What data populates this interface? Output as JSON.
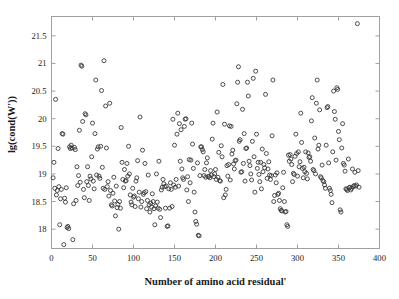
{
  "chart_data": {
    "type": "scatter",
    "title": "",
    "xlabel": "Number of amino acid residual'",
    "ylabel": "lg(cond(W'))",
    "xlim": [
      0,
      400
    ],
    "ylim": [
      17.65,
      21.85
    ],
    "xticks": [
      0,
      50,
      100,
      150,
      200,
      250,
      300,
      350,
      400
    ],
    "xticklabels": [
      "0",
      "50",
      "100",
      "150",
      "200",
      "250",
      "300",
      "350",
      "400"
    ],
    "yticks": [
      18,
      18.5,
      19,
      19.5,
      20,
      20.5,
      21,
      21.5
    ],
    "yticklabels": [
      "18",
      "18.5",
      "19",
      "19.5",
      "20",
      "20.5",
      "21",
      "21.5"
    ],
    "grid": false,
    "legend": null,
    "marker": "open-circle",
    "marker_color": "#3a3a3a",
    "marker_size": 4,
    "axis_color": "#a0a0a0",
    "background": "#ffffff",
    "n_points": 398,
    "points": [
      [
        2,
        18.93
      ],
      [
        3,
        19.21
      ],
      [
        4,
        18.74
      ],
      [
        5,
        20.35
      ],
      [
        6,
        18.62
      ],
      [
        7,
        18.7
      ],
      [
        8,
        19.46
      ],
      [
        9,
        18.77
      ],
      [
        10,
        18.08
      ],
      [
        11,
        18.55
      ],
      [
        12,
        18.72
      ],
      [
        13,
        19.73
      ],
      [
        14,
        19.72
      ],
      [
        15,
        17.72
      ],
      [
        16,
        18.56
      ],
      [
        17,
        18.49
      ],
      [
        18,
        18.75
      ],
      [
        19,
        18.03
      ],
      [
        20,
        18.05
      ],
      [
        21,
        18.01
      ],
      [
        22,
        19.49
      ],
      [
        23,
        19.46
      ],
      [
        24,
        19.52
      ],
      [
        25,
        19.47
      ],
      [
        26,
        17.81
      ],
      [
        27,
        18.46
      ],
      [
        28,
        19.48
      ],
      [
        29,
        19.44
      ],
      [
        30,
        18.52
      ],
      [
        31,
        19.13
      ],
      [
        32,
        18.79
      ],
      [
        33,
        18.97
      ],
      [
        34,
        19.79
      ],
      [
        35,
        18.85
      ],
      [
        36,
        20.97
      ],
      [
        37,
        20.95
      ],
      [
        38,
        19.95
      ],
      [
        39,
        18.72
      ],
      [
        40,
        18.57
      ],
      [
        41,
        20.09
      ],
      [
        42,
        20.07
      ],
      [
        43,
        18.86
      ],
      [
        44,
        19.13
      ],
      [
        45,
        18.79
      ],
      [
        46,
        18.52
      ],
      [
        47,
        18.96
      ],
      [
        48,
        18.91
      ],
      [
        49,
        19.31
      ],
      [
        50,
        19.92
      ],
      [
        51,
        18.87
      ],
      [
        52,
        18.73
      ],
      [
        53,
        19.73
      ],
      [
        54,
        20.7
      ],
      [
        55,
        18.98
      ],
      [
        56,
        19.45
      ],
      [
        57,
        19.49
      ],
      [
        58,
        18.96
      ],
      [
        59,
        18.92
      ],
      [
        60,
        19.5
      ],
      [
        61,
        20.51
      ],
      [
        62,
        19.12
      ],
      [
        63,
        18.74
      ],
      [
        64,
        21.05
      ],
      [
        65,
        18.72
      ],
      [
        66,
        20.23
      ],
      [
        67,
        19.47
      ],
      [
        68,
        18.77
      ],
      [
        69,
        18.86
      ],
      [
        70,
        18.6
      ],
      [
        71,
        20.28
      ],
      [
        72,
        18.7
      ],
      [
        73,
        18.44
      ],
      [
        74,
        18.42
      ],
      [
        75,
        18.65
      ],
      [
        76,
        18.94
      ],
      [
        77,
        18.51
      ],
      [
        78,
        18.24
      ],
      [
        79,
        18.78
      ],
      [
        80,
        18.39
      ],
      [
        81,
        18.45
      ],
      [
        82,
        18.0
      ],
      [
        83,
        18.5
      ],
      [
        84,
        18.38
      ],
      [
        85,
        19.84
      ],
      [
        86,
        19.21
      ],
      [
        87,
        18.9
      ],
      [
        88,
        18.75
      ],
      [
        89,
        19.08
      ],
      [
        90,
        18.87
      ],
      [
        91,
        18.88
      ],
      [
        92,
        19.19
      ],
      [
        93,
        18.96
      ],
      [
        94,
        19.5
      ],
      [
        95,
        19.0
      ],
      [
        96,
        18.62
      ],
      [
        97,
        18.49
      ],
      [
        98,
        18.44
      ],
      [
        99,
        18.74
      ],
      [
        100,
        18.58
      ],
      [
        101,
        18.6
      ],
      [
        102,
        18.41
      ],
      [
        103,
        18.87
      ],
      [
        104,
        18.93
      ],
      [
        105,
        19.24
      ],
      [
        106,
        18.55
      ],
      [
        107,
        18.67
      ],
      [
        108,
        20.03
      ],
      [
        109,
        18.4
      ],
      [
        110,
        18.5
      ],
      [
        111,
        19.43
      ],
      [
        112,
        18.63
      ],
      [
        113,
        18.66
      ],
      [
        114,
        19.19
      ],
      [
        115,
        18.68
      ],
      [
        116,
        18.37
      ],
      [
        117,
        18.52
      ],
      [
        118,
        18.98
      ],
      [
        119,
        18.44
      ],
      [
        120,
        18.31
      ],
      [
        121,
        18.47
      ],
      [
        122,
        18.4
      ],
      [
        123,
        18.64
      ],
      [
        124,
        18.5
      ],
      [
        125,
        18.37
      ],
      [
        126,
        18.08
      ],
      [
        127,
        18.42
      ],
      [
        128,
        19.0
      ],
      [
        129,
        18.49
      ],
      [
        130,
        18.38
      ],
      [
        131,
        19.23
      ],
      [
        132,
        18.36
      ],
      [
        133,
        18.21
      ],
      [
        134,
        18.71
      ],
      [
        135,
        18.76
      ],
      [
        136,
        18.9
      ],
      [
        137,
        18.82
      ],
      [
        138,
        18.77
      ],
      [
        139,
        18.38
      ],
      [
        140,
        18.78
      ],
      [
        141,
        18.05
      ],
      [
        142,
        18.06
      ],
      [
        143,
        18.73
      ],
      [
        144,
        18.38
      ],
      [
        145,
        18.84
      ],
      [
        146,
        18.72
      ],
      [
        147,
        18.41
      ],
      [
        148,
        19.99
      ],
      [
        149,
        18.8
      ],
      [
        150,
        19.52
      ],
      [
        151,
        18.76
      ],
      [
        152,
        18.9
      ],
      [
        153,
        19.72
      ],
      [
        154,
        20.1
      ],
      [
        155,
        18.78
      ],
      [
        156,
        19.91
      ],
      [
        157,
        19.23
      ],
      [
        158,
        19.8
      ],
      [
        159,
        19.09
      ],
      [
        160,
        18.93
      ],
      [
        161,
        18.9
      ],
      [
        162,
        19.86
      ],
      [
        163,
        19.99
      ],
      [
        164,
        20.0
      ],
      [
        165,
        18.71
      ],
      [
        166,
        18.95
      ],
      [
        167,
        18.5
      ],
      [
        168,
        19.26
      ],
      [
        169,
        18.84
      ],
      [
        170,
        19.25
      ],
      [
        171,
        19.92
      ],
      [
        172,
        19.54
      ],
      [
        173,
        19.1
      ],
      [
        174,
        18.67
      ],
      [
        175,
        18.31
      ],
      [
        176,
        18.14
      ],
      [
        177,
        18.09
      ],
      [
        178,
        19.2
      ],
      [
        179,
        17.89
      ],
      [
        180,
        17.88
      ],
      [
        181,
        18.97
      ],
      [
        182,
        19.49
      ],
      [
        183,
        19.49
      ],
      [
        184,
        19.44
      ],
      [
        185,
        19.4
      ],
      [
        186,
        18.97
      ],
      [
        187,
        19.08
      ],
      [
        188,
        18.94
      ],
      [
        189,
        19.2
      ],
      [
        190,
        19.29
      ],
      [
        191,
        18.95
      ],
      [
        192,
        18.96
      ],
      [
        193,
        18.93
      ],
      [
        194,
        19.06
      ],
      [
        195,
        18.98
      ],
      [
        196,
        19.63
      ],
      [
        197,
        19.92
      ],
      [
        198,
        18.95
      ],
      [
        199,
        19.0
      ],
      [
        200,
        19.08
      ],
      [
        201,
        18.9
      ],
      [
        202,
        20.12
      ],
      [
        203,
        18.94
      ],
      [
        204,
        19.39
      ],
      [
        205,
        18.88
      ],
      [
        206,
        18.87
      ],
      [
        207,
        19.51
      ],
      [
        208,
        19.31
      ],
      [
        209,
        20.62
      ],
      [
        210,
        18.57
      ],
      [
        211,
        19.9
      ],
      [
        212,
        18.62
      ],
      [
        213,
        18.72
      ],
      [
        214,
        19.15
      ],
      [
        215,
        18.96
      ],
      [
        216,
        19.17
      ],
      [
        217,
        19.87
      ],
      [
        218,
        18.89
      ],
      [
        219,
        19.86
      ],
      [
        220,
        19.36
      ],
      [
        221,
        19.43
      ],
      [
        222,
        19.18
      ],
      [
        223,
        19.09
      ],
      [
        224,
        19.24
      ],
      [
        225,
        19.25
      ],
      [
        226,
        20.27
      ],
      [
        227,
        20.66
      ],
      [
        228,
        20.94
      ],
      [
        229,
        19.59
      ],
      [
        230,
        19.62
      ],
      [
        231,
        19.03
      ],
      [
        232,
        19.04
      ],
      [
        233,
        20.17
      ],
      [
        234,
        19.19
      ],
      [
        235,
        19.73
      ],
      [
        236,
        18.87
      ],
      [
        237,
        19.46
      ],
      [
        238,
        19.47
      ],
      [
        239,
        20.66
      ],
      [
        240,
        20.41
      ],
      [
        241,
        19.23
      ],
      [
        242,
        19.15
      ],
      [
        243,
        19.0
      ],
      [
        244,
        18.89
      ],
      [
        245,
        19.59
      ],
      [
        246,
        20.73
      ],
      [
        247,
        19.31
      ],
      [
        248,
        18.67
      ],
      [
        249,
        20.86
      ],
      [
        250,
        19.72
      ],
      [
        251,
        19.1
      ],
      [
        252,
        19.21
      ],
      [
        253,
        18.99
      ],
      [
        254,
        18.86
      ],
      [
        255,
        19.21
      ],
      [
        256,
        18.73
      ],
      [
        257,
        19.45
      ],
      [
        258,
        19.04
      ],
      [
        259,
        19.17
      ],
      [
        260,
        19.11
      ],
      [
        261,
        20.44
      ],
      [
        262,
        19.37
      ],
      [
        263,
        18.92
      ],
      [
        264,
        19.09
      ],
      [
        265,
        19.22
      ],
      [
        266,
        18.98
      ],
      [
        267,
        18.9
      ],
      [
        268,
        18.97
      ],
      [
        269,
        19.69
      ],
      [
        270,
        20.7
      ],
      [
        271,
        18.5
      ],
      [
        272,
        18.61
      ],
      [
        273,
        18.98
      ],
      [
        274,
        18.84
      ],
      [
        275,
        19.02
      ],
      [
        276,
        18.63
      ],
      [
        277,
        18.65
      ],
      [
        278,
        18.52
      ],
      [
        279,
        18.37
      ],
      [
        280,
        18.34
      ],
      [
        281,
        18.33
      ],
      [
        282,
        18.75
      ],
      [
        283,
        19.03
      ],
      [
        284,
        18.5
      ],
      [
        285,
        18.31
      ],
      [
        286,
        18.32
      ],
      [
        287,
        18.08
      ],
      [
        288,
        18.05
      ],
      [
        289,
        19.34
      ],
      [
        290,
        19.23
      ],
      [
        291,
        19.35
      ],
      [
        292,
        19.27
      ],
      [
        293,
        19.17
      ],
      [
        294,
        18.86
      ],
      [
        295,
        19.01
      ],
      [
        296,
        18.99
      ],
      [
        297,
        19.32
      ],
      [
        298,
        19.72
      ],
      [
        299,
        19.37
      ],
      [
        300,
        18.96
      ],
      [
        301,
        19.4
      ],
      [
        302,
        19.13
      ],
      [
        303,
        19.22
      ],
      [
        304,
        20.1
      ],
      [
        305,
        19.57
      ],
      [
        306,
        19.1
      ],
      [
        307,
        18.93
      ],
      [
        308,
        19.12
      ],
      [
        309,
        19.04
      ],
      [
        310,
        19.4
      ],
      [
        311,
        19.01
      ],
      [
        312,
        18.91
      ],
      [
        313,
        19.38
      ],
      [
        314,
        19.3
      ],
      [
        315,
        19.31
      ],
      [
        316,
        19.23
      ],
      [
        317,
        19.96
      ],
      [
        318,
        20.38
      ],
      [
        319,
        19.08
      ],
      [
        320,
        19.06
      ],
      [
        321,
        19.65
      ],
      [
        322,
        19.0
      ],
      [
        323,
        20.28
      ],
      [
        324,
        20.7
      ],
      [
        325,
        19.45
      ],
      [
        326,
        19.52
      ],
      [
        327,
        20.16
      ],
      [
        328,
        18.95
      ],
      [
        329,
        18.93
      ],
      [
        330,
        19.16
      ],
      [
        331,
        18.88
      ],
      [
        332,
        18.86
      ],
      [
        333,
        18.8
      ],
      [
        334,
        18.74
      ],
      [
        335,
        19.52
      ],
      [
        336,
        20.2
      ],
      [
        337,
        20.22
      ],
      [
        338,
        19.2
      ],
      [
        339,
        18.74
      ],
      [
        340,
        18.7
      ],
      [
        341,
        18.63
      ],
      [
        342,
        18.48
      ],
      [
        343,
        19.4
      ],
      [
        344,
        20.5
      ],
      [
        345,
        20.13
      ],
      [
        346,
        19.99
      ],
      [
        347,
        19.25
      ],
      [
        348,
        20.56
      ],
      [
        349,
        20.53
      ],
      [
        350,
        19.77
      ],
      [
        351,
        19.62
      ],
      [
        352,
        18.35
      ],
      [
        353,
        18.31
      ],
      [
        354,
        19.47
      ],
      [
        355,
        19.91
      ],
      [
        356,
        19.19
      ],
      [
        357,
        19.16
      ],
      [
        358,
        19.05
      ],
      [
        359,
        18.73
      ],
      [
        360,
        18.72
      ],
      [
        361,
        18.7
      ],
      [
        362,
        19.27
      ],
      [
        363,
        18.75
      ],
      [
        364,
        18.76
      ],
      [
        365,
        18.71
      ],
      [
        366,
        18.74
      ],
      [
        367,
        19.09
      ],
      [
        368,
        18.77
      ],
      [
        369,
        18.79
      ],
      [
        370,
        19.03
      ],
      [
        371,
        18.78
      ],
      [
        372,
        18.8
      ],
      [
        373,
        21.72
      ],
      [
        374,
        19.06
      ],
      [
        375,
        18.76
      ]
    ]
  }
}
